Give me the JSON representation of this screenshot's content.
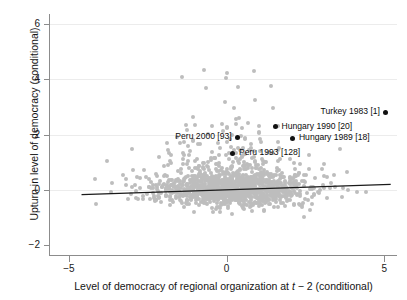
{
  "chart_data": {
    "type": "scatter",
    "title": "",
    "xlabel": "Level of democracy of regional organization at t−2 (conditional)",
    "xlabel_parts": {
      "before": "Level of democracy of regional organization at ",
      "italic": "t",
      "after": " − 2 (conditional)"
    },
    "ylabel": "Upturn in level of democracy (conditional)",
    "xlim": [
      -5.6,
      5.4
    ],
    "ylim": [
      -2.35,
      6.35
    ],
    "xticks": [
      -5,
      0,
      5
    ],
    "xticklabels": [
      "−5",
      "0",
      "5"
    ],
    "yticks": [
      -2,
      0,
      2,
      4,
      6
    ],
    "yticklabels": [
      "−2",
      "0",
      "2",
      "4",
      "6"
    ],
    "grid": "horizontal-faint",
    "legend": "none",
    "marker_color": "#bdbdbd",
    "highlight_color": "#111111",
    "fitline_color": "#1a1a1a",
    "fit_line": {
      "x0": -4.6,
      "y0": -0.17,
      "x1": 5.2,
      "y1": 0.2,
      "slope": 0.038,
      "intercept": 0.005
    },
    "highlighted_points": [
      {
        "label": "Turkey 1983 [1]",
        "x": 5.05,
        "y": 2.8,
        "label_side": "left"
      },
      {
        "label": "Hungary 1990 [20]",
        "x": 1.55,
        "y": 2.28,
        "label_side": "right"
      },
      {
        "label": "Hungary 1989 [18]",
        "x": 2.1,
        "y": 1.87,
        "label_side": "right"
      },
      {
        "label": "Peru 2000 [93]",
        "x": 0.35,
        "y": 1.9,
        "label_side": "left"
      },
      {
        "label": "Peru 1993 [128]",
        "x": 0.2,
        "y": 1.33,
        "label_side": "right"
      }
    ],
    "n_points_approx": 1400,
    "points_note": "Dense gray cloud concentrated between x=-3.5 and x=4 near y=0, with a sparse upward tail reaching y=5.8"
  }
}
